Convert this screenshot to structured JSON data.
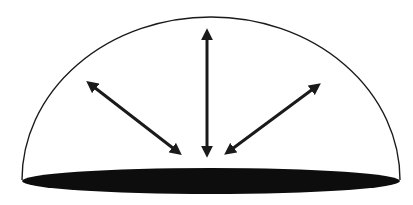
{
  "diagram": {
    "colors": {
      "background": "#ffffff",
      "stroke": "#1a1a1a",
      "base_fill": "#0d0d0d",
      "arrow": "#1a1a1a"
    },
    "dome": {
      "left_x": 22,
      "right_x": 400,
      "base_y": 180,
      "apex_y": 17,
      "apex_x": 208
    },
    "base_ellipse": {
      "cx": 211,
      "cy": 181,
      "rx": 189,
      "ry": 13
    },
    "arrows": [
      {
        "name": "left",
        "x1": 178,
        "y1": 152,
        "x2": 90,
        "y2": 84,
        "double_headed": true
      },
      {
        "name": "center",
        "x1": 207,
        "y1": 153,
        "x2": 207,
        "y2": 33,
        "double_headed": true
      },
      {
        "name": "right",
        "x1": 228,
        "y1": 152,
        "x2": 317,
        "y2": 86,
        "double_headed": true
      }
    ]
  }
}
